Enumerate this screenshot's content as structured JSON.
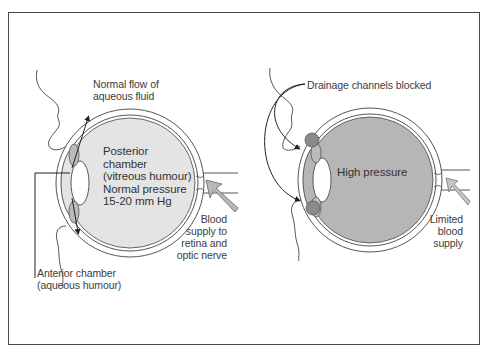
{
  "figure": {
    "colors": {
      "frame": "#4a4a4a",
      "normal_fill": "#e4e4e4",
      "high_pressure_fill": "#b6b6b6",
      "outline": "#555555",
      "blockage": "#8a8a8a"
    }
  },
  "left_panel": {
    "flow_label": "Normal flow of\naqueous fluid",
    "posterior_label": "Posterior\nchamber\n(vitreous humour)\nNormal pressure\n15-20 mm Hg",
    "blood_label": "Blood\nsupply to\nretina and\noptic nerve",
    "anterior_label": "Anterior chamber\n(aqueous humour)"
  },
  "right_panel": {
    "drainage_label": "Drainage channels blocked",
    "pressure_label": "High pressure",
    "limited_label": "Limited\nblood\nsupply"
  }
}
